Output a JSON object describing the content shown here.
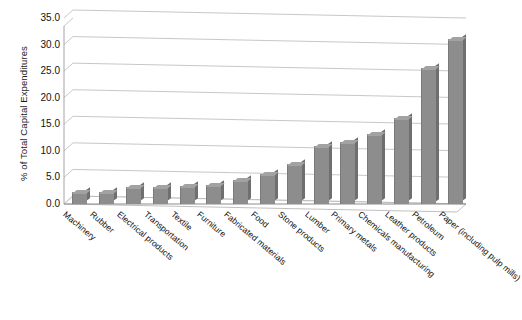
{
  "chart_data": {
    "type": "bar",
    "title": "",
    "xlabel": "",
    "ylabel": "% of Total Capital Expenditures",
    "ylim": [
      0,
      35
    ],
    "ytick_labels": [
      "0.0",
      "5.0",
      "10.0",
      "15.0",
      "20.0",
      "25.0",
      "30.0",
      "35.0"
    ],
    "ytick_values": [
      0,
      5,
      10,
      15,
      20,
      25,
      30,
      35
    ],
    "grid": true,
    "legend": "none",
    "style": "3d-column",
    "bar_color": "#8d8d8d",
    "categories": [
      "Machinery",
      "Rubber",
      "Electrical products",
      "Transportation",
      "Textile",
      "Furniture",
      "Fabricated materials",
      "Food",
      "Stone products",
      "Lumber",
      "Primary metals",
      "Chemicals manufacturing",
      "Leather products",
      "Petroleum",
      "Paper (including pulp mills)"
    ],
    "values": [
      2.0,
      2.0,
      3.0,
      3.0,
      3.2,
      3.4,
      4.3,
      5.5,
      7.3,
      10.8,
      11.5,
      13.0,
      16.0,
      25.5,
      30.8
    ]
  }
}
